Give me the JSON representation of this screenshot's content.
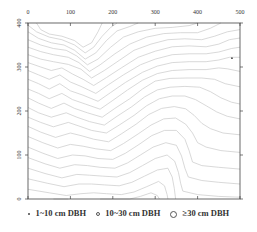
{
  "chart_data": {
    "type": "scatter",
    "title": "",
    "xlabel": "",
    "ylabel": "",
    "xlim": [
      0,
      500
    ],
    "ylim": [
      0,
      400
    ],
    "x_ticks": [
      0,
      100,
      200,
      300,
      400,
      500
    ],
    "y_ticks": [
      0,
      100,
      200,
      300,
      400
    ],
    "x_tick_position": "top",
    "grid": false,
    "background": "topographic contour lines (light gray)",
    "legend": {
      "position": "bottom",
      "entries": [
        {
          "label": "1~10 cm DBH",
          "marker": "small-dot"
        },
        {
          "label": "10~30 cm DBH",
          "marker": "small-circle"
        },
        {
          "label": "≥30 cm DBH",
          "marker": "large-circle"
        }
      ]
    },
    "series": [
      {
        "name": "1~10 cm DBH",
        "points": [
          [
            481,
            320
          ]
        ]
      },
      {
        "name": "10~30 cm DBH",
        "points": []
      },
      {
        "name": "≥30 cm DBH",
        "points": []
      }
    ],
    "contours": [
      [
        [
          20,
          400
        ],
        [
          30,
          385
        ],
        [
          50,
          375
        ],
        [
          80,
          370
        ],
        [
          110,
          360
        ],
        [
          130,
          345
        ],
        [
          150,
          355
        ],
        [
          165,
          380
        ],
        [
          175,
          400
        ]
      ],
      [
        [
          0,
          395
        ],
        [
          20,
          380
        ],
        [
          50,
          368
        ],
        [
          80,
          362
        ],
        [
          110,
          350
        ],
        [
          135,
          332
        ],
        [
          155,
          345
        ],
        [
          175,
          370
        ],
        [
          195,
          390
        ],
        [
          210,
          400
        ]
      ],
      [
        [
          0,
          380
        ],
        [
          25,
          365
        ],
        [
          55,
          355
        ],
        [
          85,
          350
        ],
        [
          110,
          338
        ],
        [
          135,
          318
        ],
        [
          160,
          332
        ],
        [
          185,
          360
        ],
        [
          210,
          382
        ],
        [
          240,
          392
        ],
        [
          260,
          400
        ]
      ],
      [
        [
          0,
          362
        ],
        [
          30,
          350
        ],
        [
          60,
          342
        ],
        [
          90,
          338
        ],
        [
          115,
          325
        ],
        [
          140,
          305
        ],
        [
          165,
          318
        ],
        [
          195,
          345
        ],
        [
          225,
          368
        ],
        [
          260,
          380
        ],
        [
          300,
          388
        ],
        [
          340,
          390
        ],
        [
          380,
          394
        ],
        [
          400,
          400
        ]
      ],
      [
        [
          0,
          345
        ],
        [
          30,
          335
        ],
        [
          60,
          328
        ],
        [
          95,
          322
        ],
        [
          120,
          310
        ],
        [
          145,
          290
        ],
        [
          170,
          305
        ],
        [
          205,
          330
        ],
        [
          240,
          352
        ],
        [
          280,
          368
        ],
        [
          320,
          376
        ],
        [
          360,
          378
        ],
        [
          400,
          378
        ],
        [
          430,
          388
        ],
        [
          455,
          400
        ]
      ],
      [
        [
          0,
          328
        ],
        [
          30,
          318
        ],
        [
          60,
          312
        ],
        [
          95,
          306
        ],
        [
          125,
          295
        ],
        [
          150,
          275
        ],
        [
          180,
          292
        ],
        [
          215,
          315
        ],
        [
          250,
          338
        ],
        [
          290,
          352
        ],
        [
          330,
          362
        ],
        [
          370,
          364
        ],
        [
          410,
          362
        ],
        [
          440,
          370
        ],
        [
          470,
          380
        ],
        [
          500,
          385
        ]
      ],
      [
        [
          0,
          310
        ],
        [
          30,
          300
        ],
        [
          55,
          292
        ],
        [
          80,
          298
        ],
        [
          105,
          284
        ],
        [
          130,
          272
        ],
        [
          155,
          258
        ],
        [
          185,
          276
        ],
        [
          220,
          298
        ],
        [
          260,
          322
        ],
        [
          300,
          336
        ],
        [
          340,
          346
        ],
        [
          380,
          348
        ],
        [
          420,
          346
        ],
        [
          450,
          352
        ],
        [
          475,
          362
        ],
        [
          500,
          366
        ]
      ],
      [
        [
          0,
          292
        ],
        [
          25,
          282
        ],
        [
          50,
          272
        ],
        [
          75,
          282
        ],
        [
          100,
          266
        ],
        [
          125,
          256
        ],
        [
          160,
          240
        ],
        [
          190,
          260
        ],
        [
          225,
          282
        ],
        [
          265,
          305
        ],
        [
          300,
          318
        ],
        [
          340,
          328
        ],
        [
          380,
          330
        ],
        [
          420,
          330
        ],
        [
          450,
          334
        ],
        [
          480,
          342
        ],
        [
          500,
          345
        ]
      ],
      [
        [
          0,
          272
        ],
        [
          25,
          262
        ],
        [
          50,
          250
        ],
        [
          75,
          262
        ],
        [
          100,
          246
        ],
        [
          130,
          236
        ],
        [
          165,
          222
        ],
        [
          195,
          242
        ],
        [
          230,
          265
        ],
        [
          270,
          288
        ],
        [
          305,
          302
        ],
        [
          340,
          310
        ],
        [
          380,
          312
        ],
        [
          420,
          312
        ],
        [
          450,
          316
        ],
        [
          475,
          322
        ],
        [
          500,
          322
        ]
      ],
      [
        [
          0,
          250
        ],
        [
          25,
          240
        ],
        [
          50,
          228
        ],
        [
          80,
          240
        ],
        [
          105,
          226
        ],
        [
          135,
          216
        ],
        [
          170,
          204
        ],
        [
          200,
          224
        ],
        [
          235,
          248
        ],
        [
          270,
          270
        ],
        [
          305,
          285
        ],
        [
          340,
          292
        ],
        [
          380,
          294
        ],
        [
          420,
          294
        ],
        [
          450,
          298
        ],
        [
          470,
          296
        ],
        [
          500,
          290
        ]
      ],
      [
        [
          0,
          230
        ],
        [
          25,
          218
        ],
        [
          55,
          206
        ],
        [
          85,
          218
        ],
        [
          110,
          206
        ],
        [
          140,
          196
        ],
        [
          175,
          186
        ],
        [
          205,
          206
        ],
        [
          240,
          228
        ],
        [
          270,
          250
        ],
        [
          300,
          268
        ],
        [
          335,
          274
        ],
        [
          375,
          275
        ],
        [
          410,
          275
        ],
        [
          440,
          272
        ],
        [
          465,
          262
        ],
        [
          500,
          255
        ]
      ],
      [
        [
          0,
          208
        ],
        [
          25,
          196
        ],
        [
          55,
          186
        ],
        [
          90,
          196
        ],
        [
          115,
          186
        ],
        [
          145,
          176
        ],
        [
          180,
          168
        ],
        [
          210,
          188
        ],
        [
          245,
          210
        ],
        [
          275,
          232
        ],
        [
          305,
          248
        ],
        [
          335,
          254
        ],
        [
          370,
          256
        ],
        [
          405,
          254
        ],
        [
          430,
          244
        ],
        [
          455,
          230
        ],
        [
          480,
          220
        ],
        [
          500,
          216
        ]
      ],
      [
        [
          0,
          186
        ],
        [
          30,
          174
        ],
        [
          60,
          164
        ],
        [
          95,
          174
        ],
        [
          120,
          166
        ],
        [
          150,
          156
        ],
        [
          185,
          150
        ],
        [
          215,
          168
        ],
        [
          250,
          190
        ],
        [
          280,
          212
        ],
        [
          310,
          228
        ],
        [
          340,
          234
        ],
        [
          370,
          234
        ],
        [
          395,
          226
        ],
        [
          420,
          212
        ],
        [
          445,
          198
        ],
        [
          470,
          188
        ],
        [
          500,
          182
        ]
      ],
      [
        [
          0,
          165
        ],
        [
          30,
          152
        ],
        [
          65,
          140
        ],
        [
          100,
          150
        ],
        [
          125,
          144
        ],
        [
          155,
          136
        ],
        [
          190,
          130
        ],
        [
          220,
          148
        ],
        [
          255,
          170
        ],
        [
          285,
          192
        ],
        [
          315,
          206
        ],
        [
          345,
          210
        ],
        [
          372,
          205
        ],
        [
          392,
          190
        ],
        [
          410,
          172
        ],
        [
          430,
          160
        ],
        [
          460,
          150
        ],
        [
          500,
          146
        ]
      ],
      [
        [
          0,
          142
        ],
        [
          35,
          128
        ],
        [
          70,
          116
        ],
        [
          100,
          124
        ],
        [
          130,
          120
        ],
        [
          160,
          114
        ],
        [
          195,
          110
        ],
        [
          225,
          126
        ],
        [
          260,
          148
        ],
        [
          290,
          168
        ],
        [
          320,
          182
        ],
        [
          348,
          184
        ],
        [
          372,
          170
        ],
        [
          388,
          150
        ],
        [
          400,
          128
        ],
        [
          420,
          118
        ],
        [
          455,
          110
        ],
        [
          500,
          106
        ]
      ],
      [
        [
          0,
          118
        ],
        [
          35,
          104
        ],
        [
          70,
          92
        ],
        [
          105,
          100
        ],
        [
          135,
          98
        ],
        [
          165,
          92
        ],
        [
          200,
          90
        ],
        [
          230,
          104
        ],
        [
          262,
          124
        ],
        [
          292,
          144
        ],
        [
          322,
          156
        ],
        [
          350,
          156
        ],
        [
          370,
          136
        ],
        [
          380,
          110
        ],
        [
          388,
          84
        ],
        [
          410,
          76
        ],
        [
          450,
          72
        ],
        [
          500,
          68
        ]
      ],
      [
        [
          0,
          94
        ],
        [
          40,
          80
        ],
        [
          75,
          70
        ],
        [
          110,
          78
        ],
        [
          140,
          76
        ],
        [
          170,
          72
        ],
        [
          205,
          70
        ],
        [
          235,
          82
        ],
        [
          265,
          100
        ],
        [
          295,
          118
        ],
        [
          325,
          128
        ],
        [
          350,
          122
        ],
        [
          362,
          98
        ],
        [
          370,
          70
        ],
        [
          378,
          50
        ],
        [
          410,
          42
        ],
        [
          450,
          38
        ],
        [
          500,
          34
        ]
      ],
      [
        [
          0,
          70
        ],
        [
          40,
          58
        ],
        [
          80,
          48
        ],
        [
          115,
          56
        ],
        [
          145,
          54
        ],
        [
          175,
          52
        ],
        [
          210,
          50
        ],
        [
          240,
          60
        ],
        [
          270,
          76
        ],
        [
          300,
          92
        ],
        [
          328,
          100
        ],
        [
          346,
          86
        ],
        [
          355,
          60
        ],
        [
          360,
          36
        ],
        [
          365,
          18
        ],
        [
          400,
          10
        ],
        [
          450,
          6
        ],
        [
          500,
          4
        ]
      ],
      [
        [
          0,
          46
        ],
        [
          45,
          36
        ],
        [
          85,
          28
        ],
        [
          120,
          34
        ],
        [
          150,
          34
        ],
        [
          180,
          32
        ],
        [
          215,
          30
        ],
        [
          245,
          38
        ],
        [
          275,
          52
        ],
        [
          305,
          66
        ],
        [
          330,
          70
        ],
        [
          340,
          50
        ],
        [
          345,
          24
        ],
        [
          348,
          0
        ]
      ],
      [
        [
          0,
          22
        ],
        [
          50,
          14
        ],
        [
          90,
          8
        ],
        [
          125,
          12
        ],
        [
          155,
          14
        ],
        [
          185,
          12
        ],
        [
          220,
          10
        ],
        [
          250,
          16
        ],
        [
          280,
          28
        ],
        [
          308,
          40
        ],
        [
          322,
          30
        ],
        [
          328,
          10
        ],
        [
          330,
          0
        ]
      ],
      [
        [
          60,
          0
        ],
        [
          95,
          0
        ]
      ],
      [
        [
          170,
          0
        ],
        [
          205,
          0
        ],
        [
          240,
          0
        ],
        [
          265,
          6
        ],
        [
          290,
          14
        ],
        [
          305,
          8
        ],
        [
          310,
          0
        ]
      ]
    ]
  },
  "axes": {
    "x_tick_labels": [
      "0",
      "100",
      "200",
      "300",
      "400",
      "500"
    ],
    "y_tick_labels": [
      "0",
      "100",
      "200",
      "300",
      "400"
    ]
  },
  "legend": {
    "small_label": "1~10 cm DBH",
    "mid_label": "10~30 cm DBH",
    "large_label": "≥30 cm DBH"
  },
  "colors": {
    "contour": "#c8c8c8",
    "axis": "#444444",
    "point": "#444444"
  }
}
